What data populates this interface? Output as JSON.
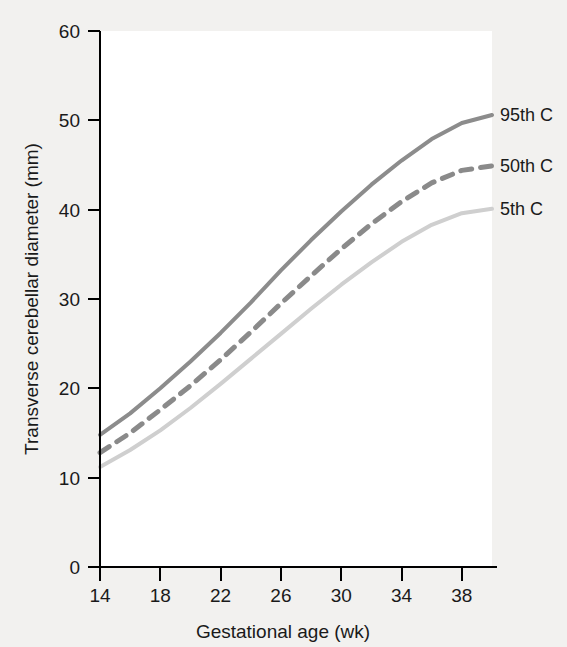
{
  "chart_data": {
    "type": "line",
    "title": "",
    "subtitle": "",
    "xlabel": "Gestational age (wk)",
    "ylabel": "Transverse cerebellar diameter (mm)",
    "xlim": [
      14,
      40
    ],
    "ylim": [
      0,
      60
    ],
    "xticks": [
      14,
      18,
      22,
      26,
      30,
      34,
      38
    ],
    "yticks": [
      0,
      10,
      20,
      30,
      40,
      50,
      60
    ],
    "grid": false,
    "legend_position": "right-inline-end-of-line",
    "x": [
      14,
      16,
      18,
      20,
      22,
      24,
      26,
      28,
      30,
      32,
      34,
      36,
      38,
      40
    ],
    "series": [
      {
        "name": "95th C",
        "label": "95th C",
        "style": "solid",
        "color": "#8c8c8c",
        "width": 4,
        "values": [
          14.8,
          17.2,
          20.0,
          23.0,
          26.2,
          29.6,
          33.2,
          36.6,
          39.8,
          42.8,
          45.5,
          47.9,
          49.7,
          50.6
        ]
      },
      {
        "name": "50th C",
        "label": "50th C",
        "style": "dashed",
        "color": "#8a8a8a",
        "width": 5,
        "values": [
          12.8,
          15.0,
          17.6,
          20.3,
          23.2,
          26.3,
          29.5,
          32.6,
          35.6,
          38.4,
          40.9,
          43.0,
          44.4,
          44.9
        ]
      },
      {
        "name": "5th C",
        "label": "5th C",
        "style": "solid",
        "color": "#cfcfcf",
        "width": 4,
        "values": [
          11.2,
          13.1,
          15.3,
          17.8,
          20.5,
          23.3,
          26.1,
          28.9,
          31.6,
          34.1,
          36.4,
          38.3,
          39.6,
          40.1
        ]
      }
    ]
  },
  "axes": {
    "x_tick_labels": [
      "14",
      "18",
      "22",
      "26",
      "30",
      "34",
      "38"
    ],
    "y_tick_labels": [
      "0",
      "10",
      "20",
      "30",
      "40",
      "50",
      "60"
    ],
    "x_title": "Gestational age (wk)",
    "y_title": "Transverse cerebellar diameter (mm)"
  },
  "legend": {
    "items": [
      {
        "label": "95th C"
      },
      {
        "label": "50th C"
      },
      {
        "label": "5th C"
      }
    ]
  },
  "colors": {
    "background": "#f2f1ef",
    "plot_area": "#ffffff",
    "axis": "#000000",
    "series_95th": "#8c8c8c",
    "series_50th": "#8a8a8a",
    "series_5th": "#cfcfcf"
  }
}
